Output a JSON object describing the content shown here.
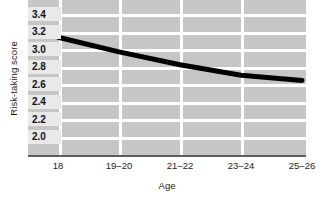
{
  "chart_data": {
    "type": "line",
    "title": "",
    "xlabel": "Age",
    "ylabel": "Risk-taking score",
    "categories": [
      "18",
      "19–20",
      "21–22",
      "23–24",
      "25–26"
    ],
    "values": [
      3.15,
      2.98,
      2.83,
      2.71,
      2.65
    ],
    "series": [
      {
        "name": "Risk-taking score",
        "values": [
          3.15,
          2.98,
          2.83,
          2.71,
          2.65
        ]
      }
    ],
    "ylim": [
      2.0,
      3.5
    ],
    "xlim": [
      0,
      4
    ],
    "ytick_labels": [
      "3.4",
      "3.2",
      "3.0",
      "2.8",
      "2.6",
      "2.4",
      "2.2",
      "2.0"
    ],
    "ytick_values": [
      3.4,
      3.2,
      3.0,
      2.8,
      2.6,
      2.4,
      2.2,
      2.0
    ],
    "xtick_labels": [
      "18",
      "19–20",
      "21–22",
      "23–24",
      "25–26"
    ],
    "grid": true,
    "legend": "none",
    "colors": {
      "plot_background": "#c6c6c6",
      "gridline": "#ffffff",
      "line": "#000000",
      "axis": "#5d5d5d",
      "tick_chip_background": "#e9e9e9",
      "text": "#1a1a1a"
    }
  }
}
